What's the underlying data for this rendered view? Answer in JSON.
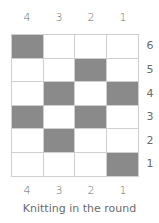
{
  "chart_data": {
    "type": "table",
    "title": "Knitting in the round",
    "column_labels": [
      "4",
      "3",
      "2",
      "1"
    ],
    "row_labels": [
      "6",
      "5",
      "4",
      "3",
      "2",
      "1"
    ],
    "cells": [
      [
        1,
        0,
        0,
        0
      ],
      [
        0,
        0,
        1,
        0
      ],
      [
        0,
        1,
        0,
        1
      ],
      [
        1,
        0,
        1,
        0
      ],
      [
        0,
        1,
        0,
        0
      ],
      [
        0,
        0,
        0,
        1
      ]
    ],
    "legend": {
      "filled": "#8a8a8a",
      "empty": "#ffffff"
    }
  },
  "columns": [
    "4",
    "3",
    "2",
    "1"
  ],
  "rows": [
    "6",
    "5",
    "4",
    "3",
    "2",
    "1"
  ],
  "caption": "Knitting in the round"
}
